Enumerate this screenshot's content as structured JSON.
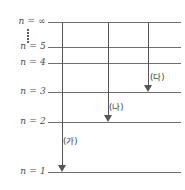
{
  "diagram": {
    "type": "energy-level-diagram",
    "levels": [
      {
        "id": "n-infinity",
        "label": "n = ∞",
        "y": 22,
        "line_x1": 48,
        "line_x2": 181
      },
      {
        "id": "n-5",
        "label": "n = 5",
        "y": 47,
        "line_x1": 48,
        "line_x2": 181
      },
      {
        "id": "n-4",
        "label": "n = 4",
        "y": 63,
        "line_x1": 48,
        "line_x2": 181
      },
      {
        "id": "n-3",
        "label": "n = 3",
        "y": 92,
        "line_x1": 48,
        "line_x2": 181
      },
      {
        "id": "n-2",
        "label": "n = 2",
        "y": 122,
        "line_x1": 48,
        "line_x2": 181
      },
      {
        "id": "n-1",
        "label": "n = 1",
        "y": 172,
        "line_x1": 48,
        "line_x2": 181
      }
    ],
    "ellipsis": {
      "name": "vertical-dots",
      "x": 28,
      "y_top": 28,
      "y_bottom": 43,
      "count": 5
    },
    "transitions": [
      {
        "id": "transition-ga",
        "label": "(가)",
        "x": 62,
        "from_y": 22,
        "to_y": 172,
        "label_x": 63,
        "label_y": 134,
        "from_level": "n = ∞",
        "to_level": "n = 1"
      },
      {
        "id": "transition-na",
        "label": "(나)",
        "x": 108,
        "from_y": 22,
        "to_y": 122,
        "label_x": 109,
        "label_y": 100,
        "from_level": "n = ∞",
        "to_level": "n = 2"
      },
      {
        "id": "transition-da",
        "label": "(다)",
        "x": 148,
        "from_y": 22,
        "to_y": 92,
        "label_x": 150,
        "label_y": 70,
        "from_level": "n = ∞",
        "to_level": "n = 3"
      }
    ],
    "colors": {
      "line": "#6e6e6e",
      "arrow": "#555555",
      "label_text": "#4a4a4a",
      "background": "#ffffff"
    }
  }
}
